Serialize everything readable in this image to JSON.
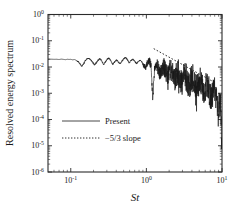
{
  "chart_data": {
    "type": "line",
    "title": "",
    "xlabel": "St",
    "ylabel": "Resolved energy spectrum",
    "xscale": "log",
    "yscale": "log",
    "xlim": [
      0.05,
      10
    ],
    "ylim": [
      1e-06,
      1
    ],
    "grid": false,
    "legend_position": "center-left",
    "xticks": [
      {
        "value": 0.1,
        "label": "10⁻¹",
        "mantissa": "10",
        "exponent": "-1"
      },
      {
        "value": 1,
        "label": "10⁰",
        "mantissa": "10",
        "exponent": "0"
      },
      {
        "value": 10,
        "label": "10¹",
        "mantissa": "10",
        "exponent": "1"
      }
    ],
    "yticks": [
      {
        "value": 1,
        "mantissa": "10",
        "exponent": "0"
      },
      {
        "value": 0.1,
        "mantissa": "10",
        "exponent": "-1"
      },
      {
        "value": 0.01,
        "mantissa": "10",
        "exponent": "-2"
      },
      {
        "value": 0.001,
        "mantissa": "10",
        "exponent": "-3"
      },
      {
        "value": 0.0001,
        "mantissa": "10",
        "exponent": "-4"
      },
      {
        "value": 1e-05,
        "mantissa": "10",
        "exponent": "-5"
      },
      {
        "value": 1e-06,
        "mantissa": "10",
        "exponent": "-6"
      }
    ],
    "series": [
      {
        "name": "Present",
        "style": "solid",
        "color": "#1a1a1a",
        "description": "Resolved energy spectrum from simulation; flat plateau near 2e-2 for St<1, inertial-range decay then steep roll-off to ~1e-5 at St=10",
        "points": [
          [
            0.05,
            0.0195
          ],
          [
            0.055,
            0.0198
          ],
          [
            0.06,
            0.0196
          ],
          [
            0.065,
            0.0197
          ],
          [
            0.07,
            0.0193
          ],
          [
            0.075,
            0.0199
          ],
          [
            0.08,
            0.0195
          ],
          [
            0.085,
            0.019
          ],
          [
            0.09,
            0.0197
          ],
          [
            0.095,
            0.0194
          ],
          [
            0.1,
            0.0196
          ],
          [
            0.106,
            0.0188
          ],
          [
            0.112,
            0.0192
          ],
          [
            0.118,
            0.018
          ],
          [
            0.125,
            0.016
          ],
          [
            0.132,
            0.013
          ],
          [
            0.14,
            0.0105
          ],
          [
            0.148,
            0.0135
          ],
          [
            0.156,
            0.0175
          ],
          [
            0.165,
            0.0205
          ],
          [
            0.174,
            0.0215
          ],
          [
            0.184,
            0.0185
          ],
          [
            0.195,
            0.015
          ],
          [
            0.206,
            0.012
          ],
          [
            0.218,
            0.0145
          ],
          [
            0.23,
            0.0185
          ],
          [
            0.243,
            0.021
          ],
          [
            0.257,
            0.017
          ],
          [
            0.272,
            0.0125
          ],
          [
            0.287,
            0.0155
          ],
          [
            0.304,
            0.02
          ],
          [
            0.321,
            0.022
          ],
          [
            0.339,
            0.017
          ],
          [
            0.359,
            0.0125
          ],
          [
            0.379,
            0.0155
          ],
          [
            0.401,
            0.019
          ],
          [
            0.424,
            0.016
          ],
          [
            0.448,
            0.013
          ],
          [
            0.473,
            0.0165
          ],
          [
            0.5,
            0.0205
          ],
          [
            0.529,
            0.023
          ],
          [
            0.559,
            0.0195
          ],
          [
            0.591,
            0.0145
          ],
          [
            0.625,
            0.0175
          ],
          [
            0.66,
            0.02
          ],
          [
            0.698,
            0.017
          ],
          [
            0.738,
            0.0135
          ],
          [
            0.78,
            0.016
          ],
          [
            0.824,
            0.0185
          ],
          [
            0.871,
            0.0155
          ],
          [
            0.921,
            0.0115
          ],
          [
            0.973,
            0.0095
          ],
          [
            1.029,
            0.014
          ],
          [
            1.087,
            0.018
          ],
          [
            1.149,
            0.011
          ],
          [
            1.215,
            0.0006
          ],
          [
            1.284,
            0.0085
          ],
          [
            1.357,
            0.0135
          ],
          [
            1.434,
            0.009
          ],
          [
            1.516,
            0.0055
          ],
          [
            1.602,
            0.008
          ],
          [
            1.694,
            0.011
          ],
          [
            1.79,
            0.007
          ],
          [
            1.892,
            0.0042
          ],
          [
            2.0,
            0.0065
          ],
          [
            2.114,
            0.0085
          ],
          [
            2.234,
            0.005
          ],
          [
            2.362,
            0.003
          ],
          [
            2.496,
            0.0048
          ],
          [
            2.638,
            0.0063
          ],
          [
            2.788,
            0.0038
          ],
          [
            2.947,
            0.0024
          ],
          [
            3.115,
            0.0039
          ],
          [
            3.292,
            0.005
          ],
          [
            3.479,
            0.003
          ],
          [
            3.677,
            0.0019
          ],
          [
            3.886,
            0.0031
          ],
          [
            4.107,
            0.004
          ],
          [
            4.341,
            0.0024
          ],
          [
            4.588,
            0.0015
          ],
          [
            4.849,
            0.0024
          ],
          [
            5.125,
            0.0031
          ],
          [
            5.416,
            0.0018
          ],
          [
            5.724,
            0.0011
          ],
          [
            6.05,
            0.0017
          ],
          [
            6.394,
            0.0022
          ],
          [
            6.758,
            0.0012
          ],
          [
            7.142,
            0.00065
          ],
          [
            7.548,
            0.001
          ],
          [
            7.977,
            0.0013
          ],
          [
            8.431,
            0.0006
          ],
          [
            8.911,
            0.0003
          ],
          [
            9.418,
            0.00045
          ],
          [
            9.7,
            0.00022
          ],
          [
            9.9,
            1e-05
          ],
          [
            10.0,
            1e-05
          ]
        ]
      },
      {
        "name": "-5/3 slope",
        "style": "dotted",
        "color": "#1a1a1a",
        "slope": -1.6667,
        "x_start": 1.25,
        "x_end": 7.6,
        "y_start": 0.05,
        "y_end": 0.0028
      }
    ],
    "legend": [
      {
        "label": "Present",
        "style": "solid"
      },
      {
        "label": "−5/3 slope",
        "style": "dotted"
      }
    ]
  },
  "figure": {
    "xlabel": "St",
    "ylabel": "Resolved energy spectrum",
    "background": "#ffffff",
    "axis_color": "#2b2b2b"
  }
}
